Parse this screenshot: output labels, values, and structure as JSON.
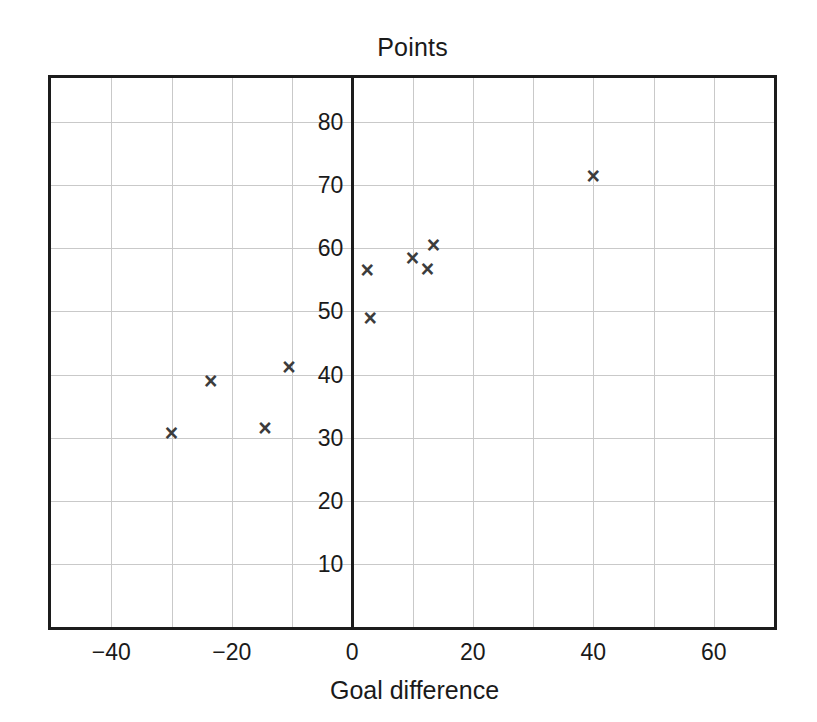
{
  "chart_data": {
    "type": "scatter",
    "title": "Points",
    "xlabel": "Goal difference",
    "ylabel": "",
    "xlim": [
      -50,
      70
    ],
    "ylim": [
      0,
      87
    ],
    "grid": true,
    "legend": "none",
    "marker": "x",
    "marker_color": "#3c3c3c",
    "grid_color": "#c9c9c9",
    "frame_color": "#1c1c1c",
    "xticks": [
      -40,
      -20,
      0,
      20,
      40,
      60
    ],
    "xtick_labels": [
      "−40",
      "−20",
      "0",
      "20",
      "40",
      "60"
    ],
    "yticks": [
      10,
      20,
      30,
      40,
      50,
      60,
      70,
      80
    ],
    "ytick_labels": [
      "10",
      "20",
      "30",
      "40",
      "50",
      "60",
      "70",
      "80"
    ],
    "x_gridlines": [
      -40,
      -30,
      -20,
      -10,
      0,
      10,
      20,
      30,
      40,
      50,
      60
    ],
    "y_gridlines": [
      10,
      20,
      30,
      40,
      50,
      60,
      70,
      80
    ],
    "points": [
      {
        "x": -30,
        "y": 30.7
      },
      {
        "x": -23.5,
        "y": 39.0
      },
      {
        "x": -14.5,
        "y": 31.5
      },
      {
        "x": -10.5,
        "y": 41.2
      },
      {
        "x": 2.5,
        "y": 56.5
      },
      {
        "x": 3.0,
        "y": 49.0
      },
      {
        "x": 10.0,
        "y": 58.5
      },
      {
        "x": 12.5,
        "y": 56.8
      },
      {
        "x": 13.5,
        "y": 60.5
      },
      {
        "x": 40.0,
        "y": 71.5
      }
    ]
  }
}
